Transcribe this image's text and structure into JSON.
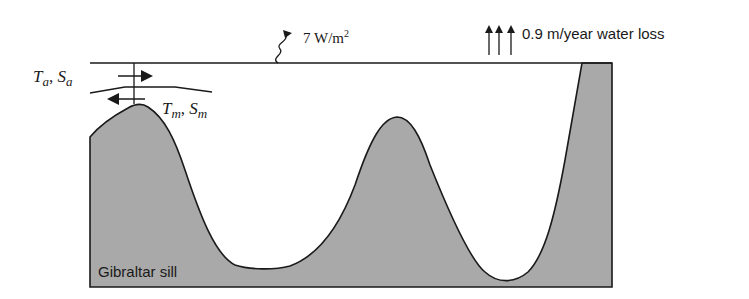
{
  "diagram": {
    "heat_flux_label": "7 W/m",
    "heat_flux_superscript": "2",
    "water_loss_label": "0.9 m/year water loss",
    "atlantic_T": "T",
    "atlantic_T_sub": "a",
    "atlantic_S": "S",
    "atlantic_S_sub": "a",
    "med_T": "T",
    "med_T_sub": "m",
    "med_S": "S",
    "med_S_sub": "m",
    "separator": ", ",
    "sill_label": "Gibraltar sill",
    "colors": {
      "seabed_fill": "#a9a9a9",
      "line": "#1a1a1a",
      "background": "#ffffff"
    }
  }
}
